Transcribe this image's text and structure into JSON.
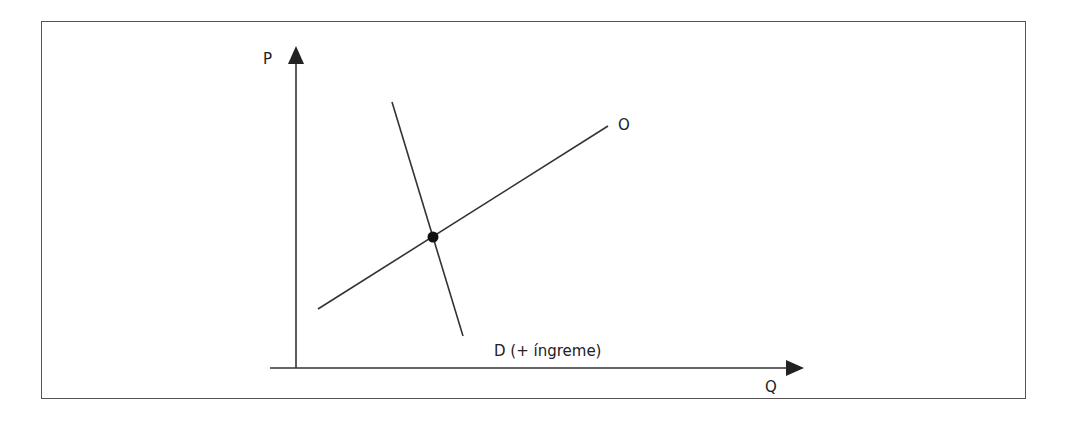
{
  "diagram": {
    "type": "supply-demand",
    "axes": {
      "y_label": "P",
      "x_label": "Q"
    },
    "curves": {
      "supply_label": "O",
      "demand_label": "D (+ íngreme)"
    },
    "colors": {
      "line": "#333333",
      "frame": "#555555",
      "background": "#ffffff"
    }
  }
}
